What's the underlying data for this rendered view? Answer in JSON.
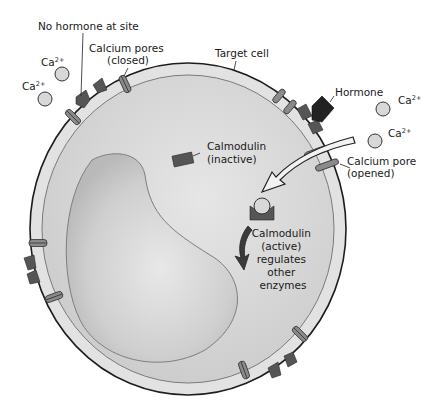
{
  "diagram": {
    "labels": {
      "no_hormone": "No hormone at site",
      "pores_closed_1": "Calcium pores",
      "pores_closed_2": "(closed)",
      "target_cell": "Target cell",
      "hormone": "Hormone",
      "ca_base": "Ca",
      "ca_sup": "2+",
      "calmodulin_inactive_1": "Calmodulin",
      "calmodulin_inactive_2": "(inactive)",
      "pore_opened_1": "Calcium pore",
      "pore_opened_2": "(opened)",
      "calmodulin_active_1": "Calmodulin",
      "calmodulin_active_2": "(active)",
      "calmodulin_active_3": "regulates",
      "calmodulin_active_4": "other",
      "calmodulin_active_5": "enzymes"
    },
    "colors": {
      "membrane_outer": "#1e1e1e",
      "membrane_fill": "#dcdcdc",
      "cytoplasm": "#d2d2d2",
      "nucleus": "#c4c4c4",
      "receptor": "#555555",
      "hormone": "#222222",
      "pore": "#8a8a8a",
      "ion": "#d8d8d8"
    }
  }
}
